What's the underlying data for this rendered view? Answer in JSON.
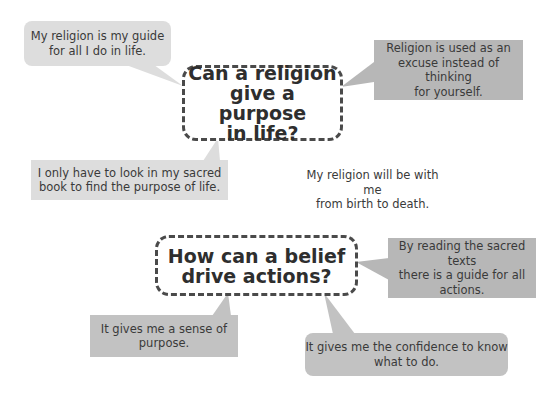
{
  "questions": [
    {
      "id": "q1",
      "lines": [
        "Can a religion",
        "give a purpose",
        "in life?"
      ]
    },
    {
      "id": "q2",
      "lines": [
        "How can a belief",
        "drive actions?"
      ]
    }
  ],
  "bubbles": {
    "guide_for_all": {
      "lines": [
        "My religion is my guide",
        "for all I do in life."
      ]
    },
    "excuse": {
      "lines": [
        "Religion is used as an",
        "excuse instead of thinking",
        "for yourself."
      ]
    },
    "sacred_book": {
      "lines": [
        "I only have to look in my sacred",
        "book to find the purpose of life."
      ]
    },
    "birth_to_death": {
      "lines": [
        "My religion will be with me",
        "from birth to death."
      ]
    },
    "sacred_texts": {
      "lines": [
        "By reading the sacred texts",
        "there is a guide for all",
        "actions."
      ]
    },
    "sense_of_purpose": {
      "lines": [
        "It gives me a sense of",
        "purpose."
      ]
    },
    "confidence": {
      "lines": [
        "It gives me the confidence to know",
        "what to do."
      ]
    }
  },
  "colors": {
    "light_gray": "#dddddd",
    "mid_gray": "#c2c2c2",
    "dark_gray": "#b7b7b7",
    "dashed_border": "#4a4a4a"
  }
}
